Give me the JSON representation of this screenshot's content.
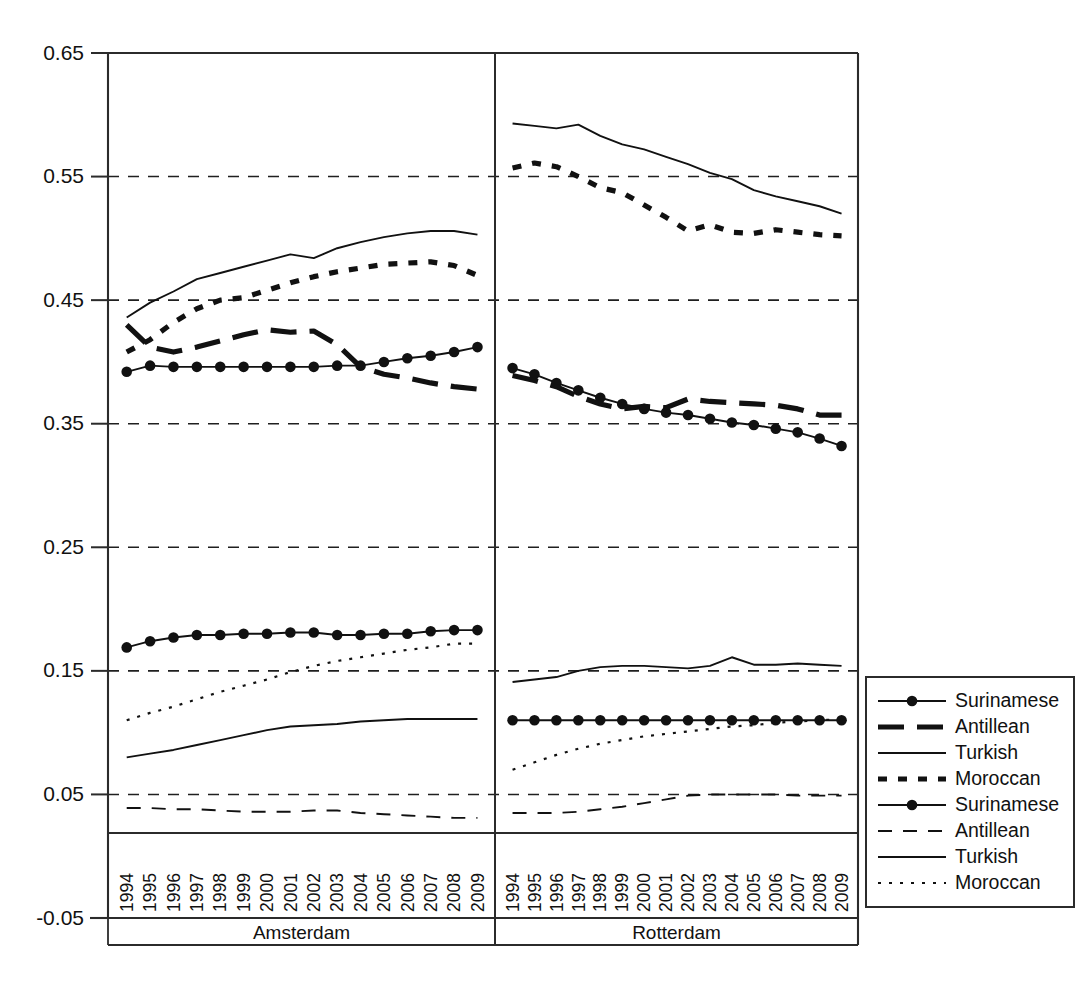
{
  "chart_data": {
    "type": "line",
    "title": "",
    "xlabel": "",
    "ylabel": "",
    "ylim": [
      -0.05,
      0.65
    ],
    "grid": "horizontal-dashed",
    "legend_position": "right-bottom",
    "y_ticks": [
      "0.65",
      "0.55",
      "0.45",
      "0.35",
      "0.25",
      "0.15",
      "0.05",
      "-0.05"
    ],
    "y_tick_values": [
      0.65,
      0.55,
      0.45,
      0.35,
      0.25,
      0.15,
      0.05,
      -0.05
    ],
    "categories": [
      "1994",
      "1995",
      "1996",
      "1997",
      "1998",
      "1999",
      "2000",
      "2001",
      "2002",
      "2003",
      "2004",
      "2005",
      "2006",
      "2007",
      "2008",
      "2009"
    ],
    "panels": [
      {
        "name": "Amsterdam",
        "label": "Amsterdam",
        "x_ticks": [
          "1994",
          "1995",
          "1996",
          "1997",
          "1998",
          "1999",
          "2000",
          "2001",
          "2002",
          "2003",
          "2004",
          "2005",
          "2006",
          "2007",
          "2008",
          "2009"
        ],
        "series": [
          {
            "name": "Surinamese",
            "group": "upper",
            "style": "solid-marker",
            "values": [
              0.392,
              0.397,
              0.396,
              0.396,
              0.396,
              0.396,
              0.396,
              0.396,
              0.396,
              0.397,
              0.397,
              0.4,
              0.403,
              0.405,
              0.408,
              0.412
            ]
          },
          {
            "name": "Antillean",
            "group": "upper",
            "style": "thick-dashed",
            "values": [
              0.43,
              0.412,
              0.408,
              0.412,
              0.417,
              0.422,
              0.426,
              0.424,
              0.425,
              0.414,
              0.396,
              0.39,
              0.387,
              0.383,
              0.38,
              0.378
            ]
          },
          {
            "name": "Turkish",
            "group": "upper",
            "style": "thin-solid",
            "values": [
              0.436,
              0.448,
              0.457,
              0.467,
              0.472,
              0.477,
              0.482,
              0.487,
              0.484,
              0.492,
              0.497,
              0.501,
              0.504,
              0.506,
              0.506,
              0.503
            ]
          },
          {
            "name": "Moroccan",
            "group": "upper",
            "style": "thick-dotted",
            "values": [
              0.408,
              0.418,
              0.432,
              0.443,
              0.45,
              0.452,
              0.458,
              0.464,
              0.469,
              0.473,
              0.476,
              0.479,
              0.48,
              0.481,
              0.478,
              0.47
            ]
          },
          {
            "name": "Surinamese",
            "group": "lower",
            "style": "solid-marker",
            "values": [
              0.169,
              0.174,
              0.177,
              0.179,
              0.179,
              0.18,
              0.18,
              0.181,
              0.181,
              0.179,
              0.179,
              0.18,
              0.18,
              0.182,
              0.183,
              0.183
            ]
          },
          {
            "name": "Antillean",
            "group": "lower",
            "style": "thin-dashed",
            "values": [
              0.039,
              0.039,
              0.038,
              0.038,
              0.037,
              0.036,
              0.036,
              0.036,
              0.037,
              0.037,
              0.035,
              0.034,
              0.033,
              0.032,
              0.031,
              0.031
            ]
          },
          {
            "name": "Turkish",
            "group": "lower",
            "style": "thin-solid",
            "values": [
              0.08,
              0.083,
              0.086,
              0.09,
              0.094,
              0.098,
              0.102,
              0.105,
              0.106,
              0.107,
              0.109,
              0.11,
              0.111,
              0.111,
              0.111,
              0.111
            ]
          },
          {
            "name": "Moroccan",
            "group": "lower",
            "style": "fine-dotted",
            "values": [
              0.11,
              0.116,
              0.121,
              0.127,
              0.133,
              0.138,
              0.143,
              0.149,
              0.154,
              0.158,
              0.161,
              0.164,
              0.167,
              0.169,
              0.172,
              0.172
            ]
          }
        ]
      },
      {
        "name": "Rotterdam",
        "label": "Rotterdam",
        "x_ticks": [
          "1994",
          "1995",
          "1996",
          "1997",
          "1998",
          "1999",
          "2000",
          "2001",
          "2002",
          "2003",
          "2004",
          "2005",
          "2006",
          "2007",
          "2008",
          "2009"
        ],
        "series": [
          {
            "name": "Surinamese",
            "group": "upper",
            "style": "solid-marker",
            "values": [
              0.395,
              0.39,
              0.383,
              0.377,
              0.371,
              0.366,
              0.362,
              0.359,
              0.357,
              0.354,
              0.351,
              0.349,
              0.346,
              0.343,
              0.338,
              0.332
            ]
          },
          {
            "name": "Antillean",
            "group": "upper",
            "style": "thick-dashed",
            "values": [
              0.389,
              0.385,
              0.38,
              0.372,
              0.366,
              0.362,
              0.364,
              0.363,
              0.37,
              0.368,
              0.367,
              0.366,
              0.365,
              0.362,
              0.357,
              0.357
            ]
          },
          {
            "name": "Turkish",
            "group": "upper",
            "style": "thin-solid",
            "values": [
              0.593,
              0.591,
              0.589,
              0.592,
              0.583,
              0.576,
              0.572,
              0.566,
              0.56,
              0.553,
              0.548,
              0.539,
              0.534,
              0.53,
              0.526,
              0.52
            ]
          },
          {
            "name": "Moroccan",
            "group": "upper",
            "style": "thick-dotted",
            "values": [
              0.557,
              0.561,
              0.558,
              0.55,
              0.541,
              0.537,
              0.527,
              0.517,
              0.506,
              0.511,
              0.505,
              0.504,
              0.507,
              0.505,
              0.503,
              0.502
            ]
          },
          {
            "name": "Surinamese",
            "group": "lower",
            "style": "solid-marker",
            "values": [
              0.11,
              0.11,
              0.11,
              0.11,
              0.11,
              0.11,
              0.11,
              0.11,
              0.11,
              0.11,
              0.11,
              0.11,
              0.11,
              0.11,
              0.11,
              0.11
            ]
          },
          {
            "name": "Antillean",
            "group": "lower",
            "style": "thin-dashed",
            "values": [
              0.035,
              0.035,
              0.035,
              0.036,
              0.038,
              0.04,
              0.043,
              0.046,
              0.049,
              0.05,
              0.05,
              0.05,
              0.05,
              0.049,
              0.049,
              0.049
            ]
          },
          {
            "name": "Turkish",
            "group": "lower",
            "style": "thin-solid",
            "values": [
              0.141,
              0.143,
              0.145,
              0.15,
              0.153,
              0.154,
              0.154,
              0.153,
              0.152,
              0.154,
              0.161,
              0.155,
              0.155,
              0.156,
              0.155,
              0.154
            ]
          },
          {
            "name": "Moroccan",
            "group": "lower",
            "style": "fine-dotted",
            "values": [
              0.07,
              0.076,
              0.082,
              0.087,
              0.091,
              0.094,
              0.097,
              0.099,
              0.101,
              0.103,
              0.105,
              0.106,
              0.108,
              0.109,
              0.11,
              0.111
            ]
          }
        ]
      }
    ],
    "legend": [
      {
        "label": "Surinamese",
        "style": "solid-marker"
      },
      {
        "label": "Antillean",
        "style": "thick-dashed"
      },
      {
        "label": "Turkish",
        "style": "thin-solid"
      },
      {
        "label": "Moroccan",
        "style": "thick-dotted"
      },
      {
        "label": "Surinamese",
        "style": "solid-marker"
      },
      {
        "label": "Antillean",
        "style": "thin-dashed"
      },
      {
        "label": "Turkish",
        "style": "thin-solid"
      },
      {
        "label": "Moroccan",
        "style": "fine-dotted"
      }
    ],
    "colors": {
      "ink": "#111111",
      "axis": "#2b2b2b",
      "background": "#ffffff"
    }
  }
}
